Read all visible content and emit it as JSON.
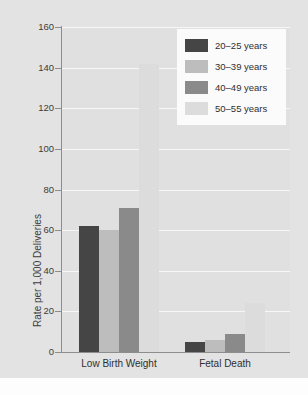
{
  "chart_data": {
    "type": "bar",
    "title": "",
    "xlabel": "",
    "ylabel": "Rate per 1,000 Deliveries",
    "ylim": [
      0,
      160
    ],
    "ytick_labels": [
      "160",
      "140",
      "120",
      "100",
      "80",
      "60",
      "40",
      "20",
      "0"
    ],
    "ytick_values": [
      160,
      140,
      120,
      100,
      80,
      60,
      40,
      20,
      0
    ],
    "grid": true,
    "legend_position": "top-right",
    "categories": [
      "Low Birth Weight",
      "Fetal Death"
    ],
    "series": [
      {
        "name": "20–25 years",
        "color": "#454545",
        "values": [
          62,
          5
        ]
      },
      {
        "name": "30–39 years",
        "color": "#bdbdbd",
        "values": [
          60,
          6
        ]
      },
      {
        "name": "40–49 years",
        "color": "#8a8a8a",
        "values": [
          71,
          9
        ]
      },
      {
        "name": "50–55 years",
        "color": "#dcdcdc",
        "values": [
          142,
          24
        ]
      }
    ]
  },
  "colors": {
    "plot_background": "#e0e0e0",
    "canvas_background": "#e3e3e3",
    "gridline": "#f7f7f7",
    "axis": "#8d8d8d",
    "text": "#2f2f2f",
    "legend_background": "#fbfbfb"
  }
}
